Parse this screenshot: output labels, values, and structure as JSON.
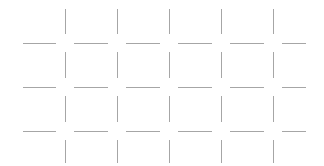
{
  "canvas": {
    "width": 324,
    "height": 166,
    "background": "#ffffff",
    "title": "dashed-grid"
  },
  "style": {
    "stroke_color": "#a6a6a6",
    "stroke_width": 1,
    "line_cap": "butt"
  },
  "grid": {
    "description": "Broken grid of short horizontal dashes and vertical ticks with gaps at every intersection",
    "horizontal_row_y": [
      43,
      87,
      131
    ],
    "vertical_column_x": [
      65,
      117,
      169,
      221,
      273
    ],
    "row_spacing": 44,
    "column_spacing": 52,
    "intersection_gap": 9,
    "horizontal_dashes": [
      {
        "row": 0,
        "y": 43,
        "x1": 23,
        "x2": 56
      },
      {
        "row": 0,
        "y": 43,
        "x1": 74,
        "x2": 108
      },
      {
        "row": 0,
        "y": 43,
        "x1": 126,
        "x2": 160
      },
      {
        "row": 0,
        "y": 43,
        "x1": 178,
        "x2": 212
      },
      {
        "row": 0,
        "y": 43,
        "x1": 230,
        "x2": 264
      },
      {
        "row": 0,
        "y": 43,
        "x1": 282,
        "x2": 306
      },
      {
        "row": 1,
        "y": 87,
        "x1": 23,
        "x2": 56
      },
      {
        "row": 1,
        "y": 87,
        "x1": 74,
        "x2": 108
      },
      {
        "row": 1,
        "y": 87,
        "x1": 126,
        "x2": 160
      },
      {
        "row": 1,
        "y": 87,
        "x1": 178,
        "x2": 212
      },
      {
        "row": 1,
        "y": 87,
        "x1": 230,
        "x2": 264
      },
      {
        "row": 1,
        "y": 87,
        "x1": 282,
        "x2": 306
      },
      {
        "row": 2,
        "y": 131,
        "x1": 23,
        "x2": 56
      },
      {
        "row": 2,
        "y": 131,
        "x1": 74,
        "x2": 108
      },
      {
        "row": 2,
        "y": 131,
        "x1": 126,
        "x2": 160
      },
      {
        "row": 2,
        "y": 131,
        "x1": 178,
        "x2": 212
      },
      {
        "row": 2,
        "y": 131,
        "x1": 230,
        "x2": 264
      },
      {
        "row": 2,
        "y": 131,
        "x1": 282,
        "x2": 306
      }
    ],
    "vertical_ticks": [
      {
        "band": 0,
        "x": 65,
        "y1": 9,
        "y2": 34
      },
      {
        "band": 0,
        "x": 117,
        "y1": 9,
        "y2": 34
      },
      {
        "band": 0,
        "x": 169,
        "y1": 9,
        "y2": 34
      },
      {
        "band": 0,
        "x": 221,
        "y1": 9,
        "y2": 34
      },
      {
        "band": 0,
        "x": 273,
        "y1": 9,
        "y2": 34
      },
      {
        "band": 1,
        "x": 65,
        "y1": 52,
        "y2": 78
      },
      {
        "band": 1,
        "x": 117,
        "y1": 52,
        "y2": 78
      },
      {
        "band": 1,
        "x": 169,
        "y1": 52,
        "y2": 78
      },
      {
        "band": 1,
        "x": 221,
        "y1": 52,
        "y2": 78
      },
      {
        "band": 1,
        "x": 273,
        "y1": 52,
        "y2": 78
      },
      {
        "band": 2,
        "x": 65,
        "y1": 96,
        "y2": 122
      },
      {
        "band": 2,
        "x": 117,
        "y1": 96,
        "y2": 122
      },
      {
        "band": 2,
        "x": 169,
        "y1": 96,
        "y2": 122
      },
      {
        "band": 2,
        "x": 221,
        "y1": 96,
        "y2": 122
      },
      {
        "band": 2,
        "x": 273,
        "y1": 96,
        "y2": 122
      },
      {
        "band": 3,
        "x": 65,
        "y1": 140,
        "y2": 163
      },
      {
        "band": 3,
        "x": 117,
        "y1": 140,
        "y2": 163
      },
      {
        "band": 3,
        "x": 169,
        "y1": 140,
        "y2": 163
      },
      {
        "band": 3,
        "x": 221,
        "y1": 140,
        "y2": 163
      },
      {
        "band": 3,
        "x": 273,
        "y1": 140,
        "y2": 163
      }
    ]
  }
}
